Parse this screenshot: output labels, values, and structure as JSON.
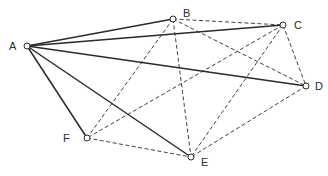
{
  "diagram": {
    "type": "complete-graph",
    "nodes": [
      {
        "id": "A",
        "label": "A",
        "x": 27,
        "y": 46,
        "lx": 9,
        "ly": 41
      },
      {
        "id": "B",
        "label": "B",
        "x": 173,
        "y": 19,
        "lx": 183,
        "ly": 8
      },
      {
        "id": "C",
        "label": "C",
        "x": 283,
        "y": 25,
        "lx": 294,
        "ly": 20
      },
      {
        "id": "D",
        "label": "D",
        "x": 306,
        "y": 86,
        "lx": 315,
        "ly": 81
      },
      {
        "id": "E",
        "label": "E",
        "x": 191,
        "y": 157,
        "lx": 201,
        "ly": 157
      },
      {
        "id": "F",
        "label": "F",
        "x": 87,
        "y": 138,
        "lx": 63,
        "ly": 133
      }
    ],
    "edges": [
      {
        "from": "A",
        "to": "B",
        "style": "solid"
      },
      {
        "from": "A",
        "to": "C",
        "style": "solid"
      },
      {
        "from": "A",
        "to": "D",
        "style": "solid"
      },
      {
        "from": "A",
        "to": "E",
        "style": "solid"
      },
      {
        "from": "A",
        "to": "F",
        "style": "solid"
      },
      {
        "from": "B",
        "to": "C",
        "style": "dashed"
      },
      {
        "from": "B",
        "to": "D",
        "style": "dashed"
      },
      {
        "from": "B",
        "to": "E",
        "style": "dashed"
      },
      {
        "from": "B",
        "to": "F",
        "style": "dashed"
      },
      {
        "from": "C",
        "to": "D",
        "style": "dashed"
      },
      {
        "from": "C",
        "to": "E",
        "style": "dashed"
      },
      {
        "from": "C",
        "to": "F",
        "style": "dashed"
      },
      {
        "from": "D",
        "to": "E",
        "style": "dashed"
      },
      {
        "from": "F",
        "to": "E",
        "style": "dashed"
      }
    ],
    "colors": {
      "line": "#2a2a2a",
      "node_fill": "#ffffff"
    }
  }
}
